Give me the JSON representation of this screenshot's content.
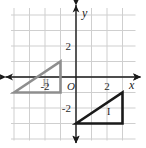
{
  "figure": {
    "background_color": "#ffffff"
  },
  "chart_data": {
    "type": "scatter",
    "title": "",
    "xlabel": "x",
    "ylabel": "y",
    "xlim": [
      -5,
      4
    ],
    "ylim": [
      -5,
      4
    ],
    "grid": true,
    "grid_step": 1,
    "grid_color": "#cfcfcf",
    "axis_color": "#1a1a1a",
    "legend": "none",
    "origin_label": "O",
    "x_tick_labels": [
      {
        "value": -2,
        "text": "-2"
      },
      {
        "value": 2,
        "text": "2"
      }
    ],
    "y_tick_labels": [
      {
        "value": 2,
        "text": "2"
      },
      {
        "value": -2,
        "text": "-2"
      }
    ],
    "shapes": [
      {
        "name": "triangle-one",
        "label": "I",
        "color": "#1a1a1a",
        "stroke_width": 2.6,
        "fill": "none",
        "vertices": [
          [
            0,
            -3
          ],
          [
            3,
            -1
          ],
          [
            3,
            -3
          ]
        ],
        "label_position": [
          2.1,
          -2.45
        ]
      },
      {
        "name": "triangle-two",
        "label": "II",
        "color": "#8e8e8e",
        "stroke_width": 2.6,
        "fill": "none",
        "vertices": [
          [
            -4,
            -1
          ],
          [
            -1,
            1
          ],
          [
            -1,
            -1
          ]
        ],
        "label_position": [
          -1.95,
          -0.55
        ]
      }
    ]
  }
}
